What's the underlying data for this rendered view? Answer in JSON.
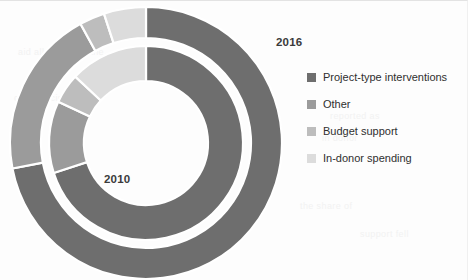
{
  "chart_data": {
    "type": "pie",
    "title": "",
    "subtitle": "",
    "xlabel": "",
    "ylabel": "",
    "grid": false,
    "legend_position": "right",
    "annotations": [
      {
        "name": "outer-ring-year",
        "text": "2016"
      },
      {
        "name": "inner-ring-year",
        "text": "2010"
      }
    ],
    "categories": [
      "Project-type interventions",
      "Other",
      "Budget support",
      "In-donor spending"
    ],
    "colors": [
      "#6e6e6e",
      "#9b9b9b",
      "#bdbdbd",
      "#dcdcdc"
    ],
    "series": [
      {
        "name": "2016",
        "ring": "outer",
        "values": [
          72,
          20,
          3,
          5
        ]
      },
      {
        "name": "2010",
        "ring": "inner",
        "values": [
          70,
          12,
          5,
          13
        ]
      }
    ]
  },
  "legend": {
    "items": [
      {
        "label": "Project-type interventions",
        "color": "#6e6e6e"
      },
      {
        "label": "Other",
        "color": "#9b9b9b"
      },
      {
        "label": "Budget support",
        "color": "#bdbdbd"
      },
      {
        "label": "In-donor spending",
        "color": "#dcdcdc"
      }
    ]
  },
  "labels": {
    "outer_year": "2016",
    "inner_year": "2010"
  },
  "background_text": {
    "lines": [
      "aid allocation to the",
      "of the recipient",
      "reported as",
      "in donor",
      "the share of",
      "support fell"
    ]
  }
}
